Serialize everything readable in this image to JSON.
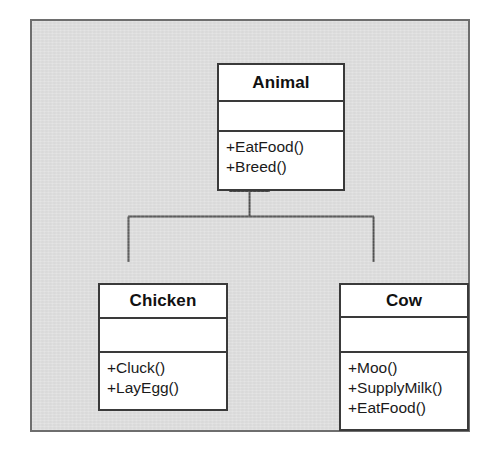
{
  "diagram": {
    "type": "uml-class-diagram",
    "frame_background_color": "#dedede",
    "frame_border_color": "#6e6e6e",
    "class_fill_color": "#ffffff",
    "class_border_color": "#3a3a3a",
    "text_color": "#111111",
    "classes": [
      {
        "id": "animal",
        "name": "Animal",
        "attributes": [],
        "operations": [
          "+EatFood()",
          "+Breed()"
        ]
      },
      {
        "id": "chicken",
        "name": "Chicken",
        "attributes": [],
        "operations": [
          "+Cluck()",
          "+LayEgg()"
        ]
      },
      {
        "id": "cow",
        "name": "Cow",
        "attributes": [],
        "operations": [
          "+Moo()",
          "+SupplyMilk()",
          "+EatFood()"
        ]
      }
    ],
    "relationships": [
      {
        "type": "generalization",
        "label": "",
        "arrow": "hollow-triangle",
        "from": "Chicken",
        "to": "Animal"
      },
      {
        "type": "generalization",
        "label": "",
        "arrow": "hollow-triangle",
        "from": "Cow",
        "to": "Animal"
      }
    ]
  }
}
